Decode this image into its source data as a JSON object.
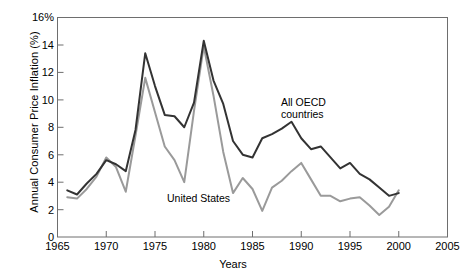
{
  "chart_data": {
    "type": "line",
    "title": "",
    "xlabel": "Years",
    "ylabel": "Annual Consumer Price Inflation (%)",
    "xlim": [
      1965,
      2005
    ],
    "ylim": [
      0,
      16
    ],
    "xticks": [
      1965,
      1970,
      1975,
      1980,
      1985,
      1990,
      1995,
      2000,
      2005
    ],
    "yticks": [
      0,
      2,
      4,
      6,
      8,
      10,
      12,
      14,
      16
    ],
    "ytick_labels": [
      "0",
      "2",
      "4",
      "6",
      "8",
      "10",
      "12",
      "14",
      "16%"
    ],
    "grid": false,
    "legend_position": "inline-annotation",
    "x": [
      1966,
      1967,
      1968,
      1969,
      1970,
      1971,
      1972,
      1973,
      1974,
      1975,
      1976,
      1977,
      1978,
      1979,
      1980,
      1981,
      1982,
      1983,
      1984,
      1985,
      1986,
      1987,
      1988,
      1989,
      1990,
      1991,
      1992,
      1993,
      1994,
      1995,
      1996,
      1997,
      1998,
      1999,
      2000
    ],
    "series": [
      {
        "name": "All OECD countries",
        "color": "#333333",
        "values": [
          3.4,
          3.1,
          3.9,
          4.6,
          5.6,
          5.3,
          4.8,
          7.8,
          13.4,
          11.0,
          8.9,
          8.8,
          8.0,
          9.8,
          14.3,
          11.4,
          9.7,
          7.0,
          6.0,
          5.8,
          7.2,
          7.5,
          7.9,
          8.4,
          7.2,
          6.4,
          6.6,
          5.8,
          5.0,
          5.4,
          4.6,
          4.2,
          3.6,
          3.0,
          3.2
        ]
      },
      {
        "name": "United States",
        "color": "#9a9a9a",
        "values": [
          2.9,
          2.8,
          3.5,
          4.4,
          5.8,
          5.1,
          3.3,
          7.4,
          11.6,
          9.1,
          6.6,
          5.6,
          4.0,
          9.2,
          13.9,
          10.3,
          6.2,
          3.2,
          4.3,
          3.5,
          1.9,
          3.6,
          4.1,
          4.8,
          5.4,
          4.2,
          3.0,
          3.0,
          2.6,
          2.8,
          2.9,
          2.3,
          1.6,
          2.2,
          3.4
        ]
      }
    ]
  },
  "annotations": {
    "oecd_label_line1": "All OECD",
    "oecd_label_line2": "countries",
    "us_label": "United States"
  }
}
